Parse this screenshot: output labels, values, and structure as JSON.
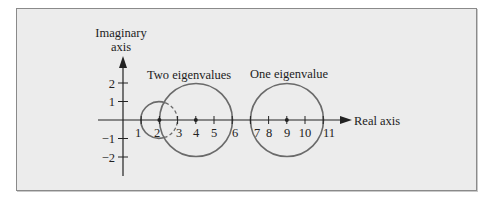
{
  "diagram": {
    "type": "gershgorin-discs",
    "labels": {
      "imaginary_axis_line1": "Imaginary",
      "imaginary_axis_line2": "axis",
      "real_axis": "Real axis",
      "group_two": "Two eigenvalues",
      "group_one": "One eigenvalue"
    },
    "x_ticks": [
      "1",
      "2",
      "3",
      "4",
      "5",
      "6",
      "7",
      "8",
      "9",
      "10",
      "11"
    ],
    "y_ticks_positive": [
      "2",
      "1"
    ],
    "y_ticks_negative": [
      "−1",
      "−2"
    ],
    "discs": [
      {
        "center": 2,
        "radius": 1,
        "style": "solid outside, dashed inside larger disc"
      },
      {
        "center": 4,
        "radius": 2,
        "style": "solid"
      },
      {
        "center": 9,
        "radius": 2,
        "style": "solid"
      }
    ],
    "colors": {
      "background": "#ececec",
      "axis": "#222222",
      "disc_outline": "#6a6a6a",
      "text": "#222222",
      "frame_border": "#8a8a8a"
    }
  }
}
